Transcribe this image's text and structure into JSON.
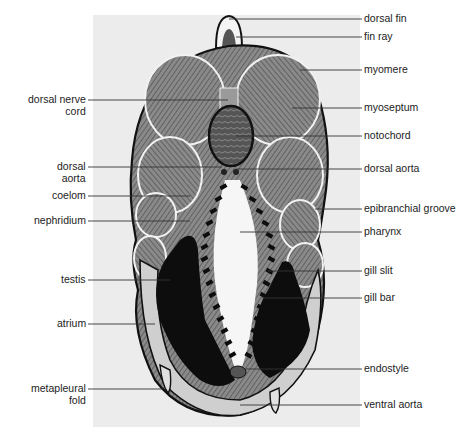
{
  "figure": {
    "panel_color": "#ececec",
    "ink_color": "#111111",
    "muscle_color": "#6a6a6a",
    "labels_left": [
      {
        "id": "dorsal-nerve-cord",
        "text": "dorsal nerve\ncord",
        "x": 88,
        "y": 100,
        "lineY": 100,
        "lineEnd": 228
      },
      {
        "id": "dorsal-aorta-left",
        "text": "dorsal\naorta",
        "x": 88,
        "y": 167,
        "lineY": 167,
        "lineEnd": 222
      },
      {
        "id": "coelom",
        "text": "coelom",
        "x": 88,
        "y": 196,
        "lineY": 196,
        "lineEnd": 190
      },
      {
        "id": "nephridium",
        "text": "nephridium",
        "x": 88,
        "y": 221,
        "lineY": 221,
        "lineEnd": 190
      },
      {
        "id": "testis",
        "text": "testis",
        "x": 88,
        "y": 280,
        "lineY": 280,
        "lineEnd": 170
      },
      {
        "id": "atrium",
        "text": "atrium",
        "x": 88,
        "y": 324,
        "lineY": 324,
        "lineEnd": 155
      },
      {
        "id": "metapleural-fold",
        "text": "metapleural\nfold",
        "x": 88,
        "y": 389,
        "lineY": 389,
        "lineEnd": 163
      }
    ],
    "labels_right": [
      {
        "id": "dorsal-fin",
        "text": "dorsal fin",
        "x": 362,
        "y": 19,
        "lineY": 19,
        "lineStart": 229
      },
      {
        "id": "fin-ray",
        "text": "fin ray",
        "x": 362,
        "y": 37,
        "lineY": 37,
        "lineStart": 236
      },
      {
        "id": "myomere",
        "text": "myomere",
        "x": 362,
        "y": 70,
        "lineY": 70,
        "lineStart": 300
      },
      {
        "id": "myoseptum",
        "text": "myoseptum",
        "x": 362,
        "y": 108,
        "lineY": 108,
        "lineStart": 292
      },
      {
        "id": "notochord",
        "text": "notochord",
        "x": 362,
        "y": 136,
        "lineY": 136,
        "lineStart": 236
      },
      {
        "id": "dorsal-aorta-right",
        "text": "dorsal aorta",
        "x": 362,
        "y": 169,
        "lineY": 169,
        "lineStart": 236
      },
      {
        "id": "epibranchial-groove",
        "text": "epibranchial groove",
        "x": 362,
        "y": 209,
        "lineY": 209,
        "lineStart": 315
      },
      {
        "id": "pharynx",
        "text": "pharynx",
        "x": 362,
        "y": 232,
        "lineY": 232,
        "lineStart": 240
      },
      {
        "id": "gill-slit",
        "text": "gill slit",
        "x": 362,
        "y": 271,
        "lineY": 271,
        "lineStart": 268
      },
      {
        "id": "gill-bar",
        "text": "gill bar",
        "x": 362,
        "y": 298,
        "lineY": 298,
        "lineStart": 262
      },
      {
        "id": "endostyle",
        "text": "endostyle",
        "x": 362,
        "y": 369,
        "lineY": 369,
        "lineStart": 246
      },
      {
        "id": "ventral-aorta",
        "text": "ventral aorta",
        "x": 362,
        "y": 405,
        "lineY": 405,
        "lineStart": 240
      }
    ]
  }
}
